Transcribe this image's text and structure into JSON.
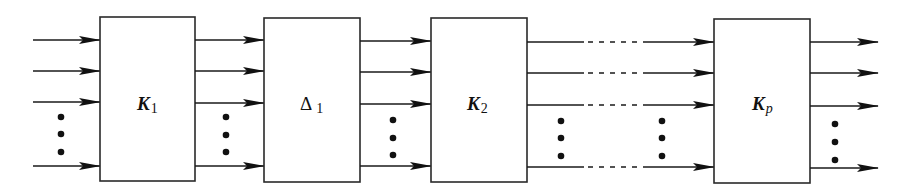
{
  "diagram": {
    "type": "block-cascade",
    "blocks": [
      {
        "id": "K1",
        "symbol": "K",
        "subscript": "1",
        "x": 100,
        "w": 95
      },
      {
        "id": "Delta1",
        "symbol": "Δ",
        "subscript": "1",
        "x": 264,
        "w": 96
      },
      {
        "id": "K2",
        "symbol": "K",
        "subscript": "2",
        "x": 431,
        "w": 96
      },
      {
        "id": "Kp",
        "symbol": "K",
        "subscript": "p",
        "x": 714,
        "w": 96
      }
    ],
    "ellipsis": "⋮",
    "colors": {
      "line": "#1a1a1a",
      "box_fill": "#ffffff"
    }
  }
}
